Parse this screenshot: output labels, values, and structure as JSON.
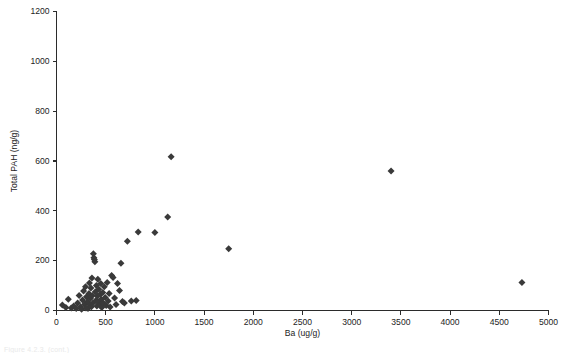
{
  "figure": {
    "background_color": "#ffffff",
    "marker_color": "#3a3a3a",
    "axis_color": "#2b2b2b",
    "caption_partial": "Figure 4.2.3. (cont.)"
  },
  "chart_data": {
    "type": "scatter",
    "title": "",
    "subtitle": "",
    "xlabel": "Ba (ug/g)",
    "ylabel": "Total PAH (ng/g)",
    "xlim": [
      0,
      5000
    ],
    "ylim": [
      0,
      1200
    ],
    "xticks": [
      0,
      500,
      1000,
      1500,
      2000,
      2500,
      3000,
      3500,
      4000,
      4500,
      5000
    ],
    "yticks": [
      0,
      200,
      400,
      600,
      800,
      1000,
      1200
    ],
    "xtick_labels": [
      "0",
      "500",
      "1000",
      "1500",
      "2000",
      "2500",
      "3000",
      "3500",
      "4000",
      "4500",
      "5000"
    ],
    "ytick_labels": [
      "0",
      "200",
      "400",
      "600",
      "800",
      "1000",
      "1200"
    ],
    "grid": false,
    "legend": null,
    "legend_position": "none",
    "marker_shape": "diamond",
    "marker_size": 7,
    "annotations": [],
    "series": [
      {
        "name": "Samples",
        "points": [
          [
            60,
            22
          ],
          [
            95,
            12
          ],
          [
            120,
            45
          ],
          [
            150,
            10
          ],
          [
            175,
            18
          ],
          [
            200,
            8
          ],
          [
            215,
            30
          ],
          [
            230,
            60
          ],
          [
            245,
            15
          ],
          [
            255,
            5
          ],
          [
            265,
            42
          ],
          [
            275,
            78
          ],
          [
            285,
            25
          ],
          [
            295,
            95
          ],
          [
            300,
            10
          ],
          [
            305,
            55
          ],
          [
            315,
            35
          ],
          [
            320,
            8
          ],
          [
            330,
            68
          ],
          [
            335,
            110
          ],
          [
            340,
            22
          ],
          [
            345,
            48
          ],
          [
            350,
            90
          ],
          [
            355,
            15
          ],
          [
            360,
            130
          ],
          [
            365,
            60
          ],
          [
            370,
            30
          ],
          [
            375,
            228
          ],
          [
            380,
            212
          ],
          [
            385,
            205
          ],
          [
            390,
            196
          ],
          [
            395,
            75
          ],
          [
            400,
            40
          ],
          [
            405,
            100
          ],
          [
            410,
            18
          ],
          [
            415,
            58
          ],
          [
            420,
            125
          ],
          [
            425,
            35
          ],
          [
            430,
            85
          ],
          [
            440,
            22
          ],
          [
            445,
            65
          ],
          [
            450,
            108
          ],
          [
            455,
            45
          ],
          [
            460,
            12
          ],
          [
            470,
            72
          ],
          [
            475,
            30
          ],
          [
            485,
            95
          ],
          [
            495,
            52
          ],
          [
            505,
            20
          ],
          [
            515,
            112
          ],
          [
            525,
            38
          ],
          [
            535,
            68
          ],
          [
            545,
            14
          ],
          [
            560,
            140
          ],
          [
            575,
            132
          ],
          [
            590,
            50
          ],
          [
            605,
            24
          ],
          [
            620,
            108
          ],
          [
            640,
            80
          ],
          [
            655,
            190
          ],
          [
            670,
            36
          ],
          [
            690,
            30
          ],
          [
            720,
            278
          ],
          [
            760,
            38
          ],
          [
            810,
            40
          ],
          [
            830,
            315
          ],
          [
            1000,
            313
          ],
          [
            1130,
            375
          ],
          [
            1165,
            617
          ],
          [
            1750,
            248
          ],
          [
            3400,
            560
          ],
          [
            4730,
            112
          ]
        ]
      }
    ]
  }
}
